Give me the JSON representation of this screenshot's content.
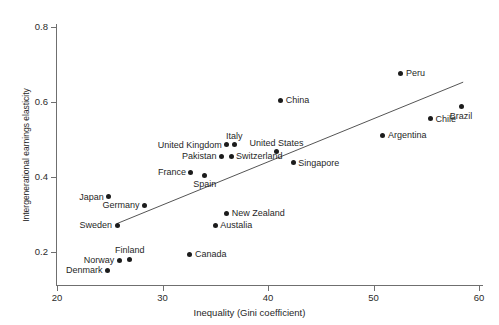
{
  "chart_data": {
    "type": "scatter",
    "title": "",
    "xlabel": "Inequality (Gini coefficient)",
    "ylabel": "Intergenerational earnings elasticity",
    "xlim": [
      20,
      60
    ],
    "ylim": [
      0.13,
      0.84
    ],
    "xticks": [
      20,
      30,
      40,
      50,
      60
    ],
    "yticks": [
      0.2,
      0.4,
      0.6,
      0.8
    ],
    "xtick_labels": [
      "20",
      "30",
      "40",
      "50",
      "60"
    ],
    "ytick_labels": [
      "0.2",
      "0.4",
      "0.6",
      "0.8"
    ],
    "grid": false,
    "legend": "none",
    "marker_color": "#1c1c1c",
    "axis_color": "#6f6f6f",
    "trend_line": {
      "description": "fitted regression line",
      "color": "#555555",
      "x_start": 25.7,
      "y_start": 0.276,
      "x_end": 58.5,
      "y_end": 0.653
    },
    "points": [
      {
        "label": "Peru",
        "x": 52.6,
        "y": 0.677,
        "label_pos": "right"
      },
      {
        "label": "Brazil",
        "x": 58.3,
        "y": 0.587,
        "label_pos": "below"
      },
      {
        "label": "Chile",
        "x": 55.4,
        "y": 0.555,
        "label_pos": "right"
      },
      {
        "label": "Argentina",
        "x": 50.9,
        "y": 0.512,
        "label_pos": "right"
      },
      {
        "label": "China",
        "x": 41.2,
        "y": 0.605,
        "label_pos": "right"
      },
      {
        "label": "Italy",
        "x": 36.8,
        "y": 0.486,
        "label_pos": "above"
      },
      {
        "label": "United Kingdom",
        "x": 36.1,
        "y": 0.486,
        "label_pos": "left"
      },
      {
        "label": "Switzerland",
        "x": 36.5,
        "y": 0.456,
        "label_pos": "right"
      },
      {
        "label": "Pakistan",
        "x": 35.6,
        "y": 0.456,
        "label_pos": "left"
      },
      {
        "label": "United States",
        "x": 40.8,
        "y": 0.467,
        "label_pos": "above"
      },
      {
        "label": "Singapore",
        "x": 42.4,
        "y": 0.438,
        "label_pos": "right"
      },
      {
        "label": "France",
        "x": 32.7,
        "y": 0.413,
        "label_pos": "left"
      },
      {
        "label": "Spain",
        "x": 34.0,
        "y": 0.405,
        "label_pos": "below"
      },
      {
        "label": "Japan",
        "x": 24.9,
        "y": 0.347,
        "label_pos": "left"
      },
      {
        "label": "Germany",
        "x": 28.3,
        "y": 0.325,
        "label_pos": "left"
      },
      {
        "label": "Sweden",
        "x": 25.7,
        "y": 0.272,
        "label_pos": "left"
      },
      {
        "label": "New Zealand",
        "x": 36.1,
        "y": 0.304,
        "label_pos": "right"
      },
      {
        "label": "Austalia",
        "x": 35.0,
        "y": 0.272,
        "label_pos": "right"
      },
      {
        "label": "Canada",
        "x": 32.6,
        "y": 0.194,
        "label_pos": "right"
      },
      {
        "label": "Finland",
        "x": 26.9,
        "y": 0.181,
        "label_pos": "above"
      },
      {
        "label": "Norway",
        "x": 25.9,
        "y": 0.178,
        "label_pos": "left"
      },
      {
        "label": "Denmark",
        "x": 24.8,
        "y": 0.152,
        "label_pos": "left"
      }
    ]
  }
}
